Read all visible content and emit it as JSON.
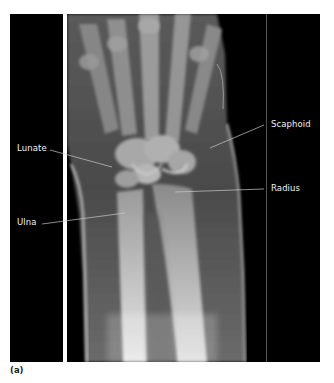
{
  "figure": {
    "caption": "(a)",
    "labels": {
      "lunate": "Lunate",
      "scaphoid": "Scaphoid",
      "radius": "Radius",
      "ulna": "Ulna"
    },
    "colors": {
      "background_panel": "#000000",
      "label_text": "#f2f2f2",
      "leader_line": "#bbbbbb",
      "page": "#ffffff"
    }
  }
}
